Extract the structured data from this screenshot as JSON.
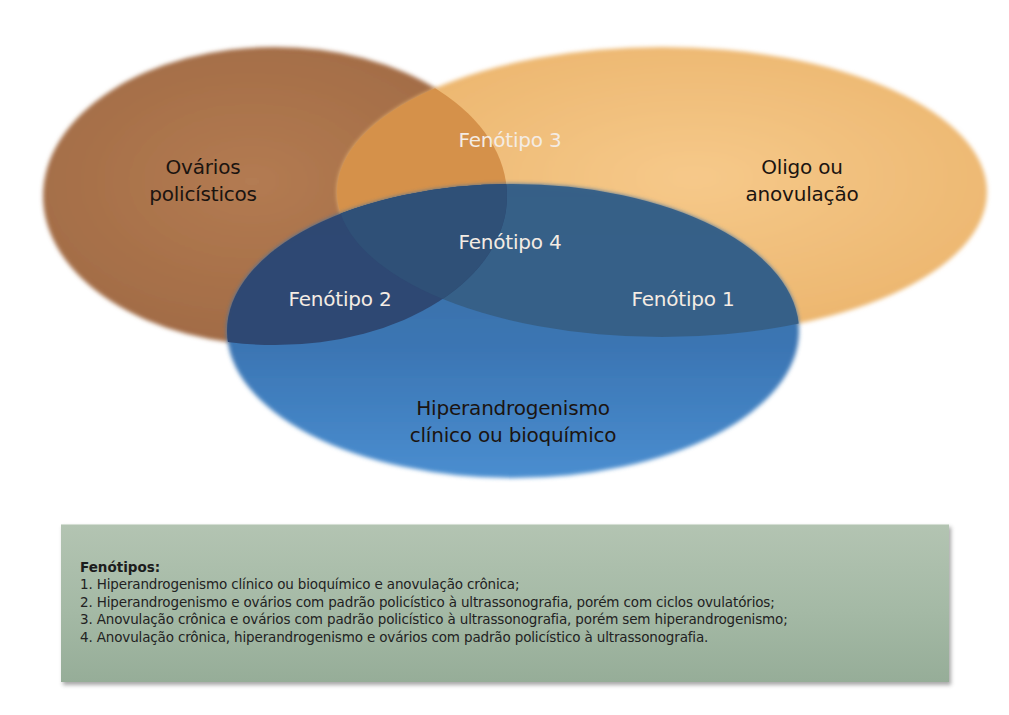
{
  "diagram": {
    "type": "venn",
    "sets": [
      {
        "id": "ovarios",
        "label_lines": [
          "Ovários",
          "policísticos"
        ],
        "color": "#a8714a"
      },
      {
        "id": "anovulacao",
        "label_lines": [
          "Oligo ou",
          "anovulação"
        ],
        "color": "#f0bf7a"
      },
      {
        "id": "hiperandrogenismo",
        "label_lines": [
          "Hiperandrogenismo",
          "clínico ou bioquímico"
        ],
        "color": "#3f7fc0"
      }
    ],
    "regions": {
      "fenotipo_1": "Fenótipo 1",
      "fenotipo_2": "Fenótipo 2",
      "fenotipo_3": "Fenótipo 3",
      "fenotipo_4": "Fenótipo 4"
    }
  },
  "legend": {
    "title": "Fenótipos:",
    "items": [
      "1. Hiperandrogenismo clínico ou bioquímico e anovulação crônica;",
      "2. Hiperandrogenismo e ovários com padrão policístico à ultrassonografia, porém com ciclos ovulatórios;",
      "3. Anovulação crônica e ovários com padrão policístico à ultrassonografia, porém sem hiperandrogenismo;",
      "4. Anovulação crônica, hiperandrogenismo e ovários com padrão policístico à ultrassonografia."
    ],
    "background": "#a9bca9"
  }
}
